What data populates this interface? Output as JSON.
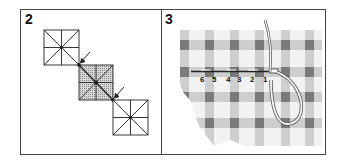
{
  "figure": {
    "panels": [
      {
        "id": "panel-2",
        "label": "2",
        "description": "Three stitch grid squares placed diagonally; middle square shaded; arrows point to joining corners"
      },
      {
        "id": "panel-3",
        "label": "3",
        "description": "Needle and thread working a running stitch across gingham fabric",
        "stitch_numbers": [
          "6",
          "5",
          "4",
          "3",
          "2",
          "1"
        ]
      }
    ],
    "colors": {
      "border": "#444444",
      "ink": "#222222",
      "shade": "#bdbdbd",
      "gingham_dark": "#7a7a7a",
      "gingham_mid": "#c4c4c4",
      "gingham_light": "#f2f2f2",
      "thread": "#f7f7f7"
    }
  }
}
